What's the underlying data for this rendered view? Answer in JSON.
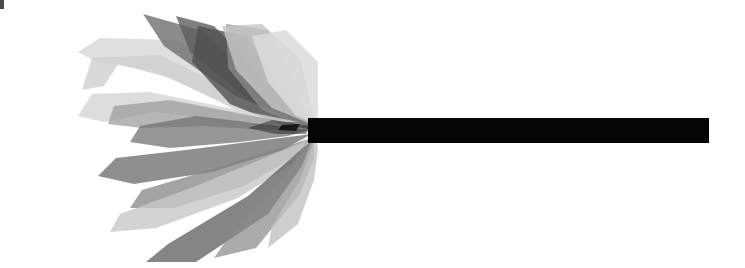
{
  "figure": {
    "caption": "",
    "width": 745,
    "height": 268,
    "background_color": "#ffffff",
    "corner_mark_color": "#4a4a4a"
  },
  "palette": {
    "white": "#ffffff",
    "lightest_gray": "#e6e6e6",
    "light_gray": "#d2d2d2",
    "mid_light_gray": "#bcbcbc",
    "mid_gray": "#9a9a9a",
    "mid_dark_gray": "#7a7a7a",
    "dark_gray": "#5e5e5e",
    "darker_gray": "#4a4a4a",
    "near_black": "#1a1a1a",
    "black": "#050505"
  },
  "chart_data": {
    "type": "scatter",
    "title": "",
    "xlabel": "",
    "ylabel": "",
    "grid": false,
    "legend": null,
    "xlim": [
      0,
      745
    ],
    "ylim": [
      0,
      268
    ],
    "convergence_point": [
      312,
      130
    ],
    "shaft": {
      "name": "horizontal-shaft",
      "x_start": 308,
      "x_end": 709,
      "y_top": 118,
      "y_bottom": 143,
      "color": "#050505"
    },
    "blades": [
      {
        "name": "blade-upper-pale-wide",
        "fill": "#d9d9d9",
        "opacity": 0.85,
        "points": [
          [
            312,
            128
          ],
          [
            178,
            40
          ],
          [
            100,
            38
          ],
          [
            78,
            52
          ],
          [
            96,
            62
          ],
          [
            150,
            70
          ],
          [
            210,
            96
          ],
          [
            268,
            120
          ]
        ]
      },
      {
        "name": "blade-upper-pale-hook",
        "fill": "#cfcfcf",
        "opacity": 0.8,
        "points": [
          [
            300,
            125
          ],
          [
            160,
            55
          ],
          [
            92,
            58
          ],
          [
            82,
            90
          ],
          [
            104,
            86
          ],
          [
            118,
            64
          ],
          [
            170,
            78
          ],
          [
            240,
            112
          ]
        ]
      },
      {
        "name": "blade-upper-spike-a",
        "fill": "#6b6b6b",
        "opacity": 0.78,
        "points": [
          [
            310,
            127
          ],
          [
            200,
            30
          ],
          [
            143,
            14
          ],
          [
            164,
            46
          ],
          [
            236,
            96
          ]
        ]
      },
      {
        "name": "blade-upper-spike-b",
        "fill": "#5e5e5e",
        "opacity": 0.8,
        "points": [
          [
            312,
            129
          ],
          [
            214,
            26
          ],
          [
            176,
            16
          ],
          [
            190,
            52
          ],
          [
            252,
            102
          ]
        ]
      },
      {
        "name": "blade-upper-dark-wide",
        "fill": "#4e4e4e",
        "opacity": 0.78,
        "points": [
          [
            313,
            130
          ],
          [
            246,
            36
          ],
          [
            198,
            26
          ],
          [
            192,
            62
          ],
          [
            230,
            104
          ],
          [
            280,
            124
          ]
        ]
      },
      {
        "name": "blade-upper-mid-broad",
        "fill": "#8e8e8e",
        "opacity": 0.72,
        "points": [
          [
            314,
            128
          ],
          [
            268,
            30
          ],
          [
            226,
            24
          ],
          [
            228,
            68
          ],
          [
            262,
            110
          ],
          [
            296,
            124
          ]
        ]
      },
      {
        "name": "blade-crest-pale-dome",
        "fill": "#c6c6c6",
        "opacity": 0.8,
        "points": [
          [
            316,
            126
          ],
          [
            300,
            58
          ],
          [
            262,
            24
          ],
          [
            222,
            26
          ],
          [
            236,
            70
          ],
          [
            272,
            108
          ]
        ]
      },
      {
        "name": "blade-upper-outer-pale",
        "fill": "#dcdcdc",
        "opacity": 0.85,
        "points": [
          [
            318,
            124
          ],
          [
            318,
            62
          ],
          [
            286,
            30
          ],
          [
            252,
            36
          ],
          [
            268,
            82
          ],
          [
            296,
            116
          ]
        ]
      },
      {
        "name": "blade-left-pale-arm",
        "fill": "#d4d4d4",
        "opacity": 0.8,
        "points": [
          [
            298,
            122
          ],
          [
            150,
            92
          ],
          [
            92,
            94
          ],
          [
            78,
            116
          ],
          [
            104,
            122
          ],
          [
            156,
            112
          ],
          [
            230,
            122
          ]
        ]
      },
      {
        "name": "blade-left-mid-arm",
        "fill": "#9c9c9c",
        "opacity": 0.74,
        "points": [
          [
            306,
            126
          ],
          [
            170,
            100
          ],
          [
            114,
            106
          ],
          [
            108,
            124
          ],
          [
            142,
            128
          ],
          [
            206,
            126
          ],
          [
            266,
            130
          ]
        ]
      },
      {
        "name": "blade-left-dark-arm",
        "fill": "#6e6e6e",
        "opacity": 0.72,
        "points": [
          [
            310,
            130
          ],
          [
            196,
            116
          ],
          [
            140,
            126
          ],
          [
            130,
            142
          ],
          [
            170,
            148
          ],
          [
            240,
            142
          ],
          [
            288,
            136
          ]
        ]
      },
      {
        "name": "blade-lower-dark-long",
        "fill": "#6a6a6a",
        "opacity": 0.75,
        "points": [
          [
            312,
            134
          ],
          [
            186,
            150
          ],
          [
            116,
            158
          ],
          [
            98,
            176
          ],
          [
            134,
            184
          ],
          [
            212,
            172
          ],
          [
            282,
            150
          ]
        ]
      },
      {
        "name": "blade-lower-mid-long",
        "fill": "#818181",
        "opacity": 0.72,
        "points": [
          [
            312,
            138
          ],
          [
            210,
            170
          ],
          [
            142,
            190
          ],
          [
            130,
            208
          ],
          [
            174,
            208
          ],
          [
            244,
            186
          ],
          [
            296,
            156
          ]
        ]
      },
      {
        "name": "blade-lower-pale-long",
        "fill": "#c8c8c8",
        "opacity": 0.8,
        "points": [
          [
            308,
            140
          ],
          [
            196,
            186
          ],
          [
            120,
            214
          ],
          [
            110,
            232
          ],
          [
            156,
            228
          ],
          [
            238,
            198
          ],
          [
            292,
            164
          ]
        ]
      },
      {
        "name": "blade-lower-dark-fan",
        "fill": "#5f5f5f",
        "opacity": 0.76,
        "points": [
          [
            312,
            140
          ],
          [
            248,
            196
          ],
          [
            168,
            244
          ],
          [
            146,
            262
          ],
          [
            196,
            262
          ],
          [
            268,
            214
          ],
          [
            302,
            166
          ]
        ]
      },
      {
        "name": "blade-lower-mid-fan",
        "fill": "#8a8a8a",
        "opacity": 0.72,
        "points": [
          [
            314,
            138
          ],
          [
            276,
            186
          ],
          [
            228,
            238
          ],
          [
            214,
            258
          ],
          [
            256,
            248
          ],
          [
            300,
            194
          ],
          [
            314,
            158
          ]
        ]
      },
      {
        "name": "blade-lower-pale-fan",
        "fill": "#c0c0c0",
        "opacity": 0.78,
        "points": [
          [
            316,
            136
          ],
          [
            300,
            180
          ],
          [
            272,
            226
          ],
          [
            268,
            248
          ],
          [
            298,
            224
          ],
          [
            314,
            180
          ],
          [
            318,
            150
          ]
        ]
      },
      {
        "name": "blade-core-shadow",
        "fill": "#2b2b2b",
        "opacity": 0.55,
        "points": [
          [
            310,
            126
          ],
          [
            272,
            120
          ],
          [
            248,
            128
          ],
          [
            276,
            134
          ],
          [
            306,
            134
          ]
        ]
      },
      {
        "name": "blade-core-notch",
        "fill": "#101010",
        "opacity": 0.9,
        "points": [
          [
            300,
            124
          ],
          [
            282,
            125
          ],
          [
            278,
            130
          ],
          [
            296,
            131
          ]
        ]
      }
    ]
  }
}
